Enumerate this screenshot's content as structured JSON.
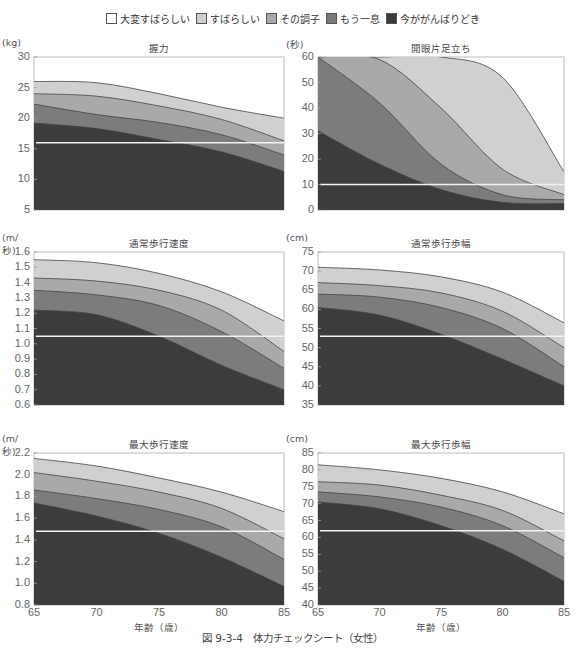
{
  "legend": [
    {
      "label": "大変すばらしい",
      "color": "#ffffff"
    },
    {
      "label": "すばらしい",
      "color": "#cfcfcf"
    },
    {
      "label": "その調子",
      "color": "#a8a8a8"
    },
    {
      "label": "もう一息",
      "color": "#7a7a7a"
    },
    {
      "label": "今ががんばりどき",
      "color": "#3a3a3a"
    }
  ],
  "caption": "図 9-3-4　体力チェックシート（女性）",
  "xlabel": "年齢（歳）",
  "chart_data": [
    {
      "type": "area",
      "title": "握力",
      "unit": "(kg)",
      "ylim": [
        5,
        30
      ],
      "yticks": [
        "30",
        "25",
        "20",
        "15",
        "10",
        "5"
      ],
      "x": [
        65,
        70,
        75,
        80,
        85
      ],
      "threshold": 16,
      "series": [
        {
          "name": "すばらしい",
          "values": [
            26,
            25.8,
            24,
            21.8,
            20
          ]
        },
        {
          "name": "その調子",
          "values": [
            24,
            23.6,
            22,
            19.8,
            16.3
          ]
        },
        {
          "name": "もう一息",
          "values": [
            22.3,
            20.6,
            19.3,
            17.3,
            14
          ]
        },
        {
          "name": "今ががんばりどき",
          "values": [
            19.2,
            18.3,
            16.5,
            14.5,
            11.3
          ]
        }
      ]
    },
    {
      "type": "area",
      "title": "開眼片足立ち",
      "unit": "(秒)",
      "ylim": [
        0,
        60
      ],
      "yticks": [
        "60",
        "50",
        "40",
        "30",
        "20",
        "10",
        "0"
      ],
      "x": [
        65,
        70,
        75,
        80,
        85
      ],
      "threshold": 10,
      "series": [
        {
          "name": "すばらしい",
          "values": [
            60,
            60,
            60,
            52,
            15
          ]
        },
        {
          "name": "その調子",
          "values": [
            60,
            59,
            40,
            16,
            6
          ]
        },
        {
          "name": "もう一息",
          "values": [
            60,
            42,
            18,
            6,
            4
          ]
        },
        {
          "name": "今ががんばりどき",
          "values": [
            31,
            18,
            8,
            3,
            2.5
          ]
        }
      ]
    },
    {
      "type": "area",
      "title": "通常歩行速度",
      "unit": "(m/ 秒)",
      "ylim": [
        0.6,
        1.6
      ],
      "yticks": [
        "1.6",
        "1.5",
        "1.4",
        "1.3",
        "1.2",
        "1.1",
        "1.0",
        "0.9",
        "0.8",
        "0.7",
        "0.6"
      ],
      "x": [
        65,
        70,
        75,
        80,
        85
      ],
      "threshold": 1.05,
      "series": [
        {
          "name": "すばらしい",
          "values": [
            1.55,
            1.53,
            1.46,
            1.34,
            1.15
          ]
        },
        {
          "name": "その調子",
          "values": [
            1.43,
            1.41,
            1.35,
            1.22,
            0.95
          ]
        },
        {
          "name": "もう一息",
          "values": [
            1.35,
            1.32,
            1.25,
            1.08,
            0.84
          ]
        },
        {
          "name": "今ががんばりどき",
          "values": [
            1.22,
            1.19,
            1.05,
            0.86,
            0.7
          ]
        }
      ]
    },
    {
      "type": "area",
      "title": "通常歩行歩幅",
      "unit": "(cm)",
      "ylim": [
        35,
        75
      ],
      "yticks": [
        "75",
        "70",
        "65",
        "60",
        "55",
        "50",
        "45",
        "40",
        "35"
      ],
      "x": [
        65,
        70,
        75,
        80,
        85
      ],
      "threshold": 53,
      "series": [
        {
          "name": "すばらしい",
          "values": [
            71,
            70.3,
            68.5,
            64.5,
            56.5
          ]
        },
        {
          "name": "その調子",
          "values": [
            67,
            66.2,
            64.3,
            59.5,
            50
          ]
        },
        {
          "name": "もう一息",
          "values": [
            64,
            63.2,
            60.5,
            55,
            45
          ]
        },
        {
          "name": "今ががんばりどき",
          "values": [
            60.5,
            58.5,
            53.5,
            47,
            40
          ]
        }
      ]
    },
    {
      "type": "area",
      "title": "最大歩行速度",
      "unit": "(m/ 秒)",
      "ylim": [
        0.8,
        2.2
      ],
      "yticks": [
        "2.2",
        "2.0",
        "1.8",
        "1.6",
        "1.4",
        "1.2",
        "1.0",
        "0.8"
      ],
      "x": [
        65,
        70,
        75,
        80,
        85
      ],
      "threshold": 1.48,
      "xticks": [
        "65",
        "70",
        "75",
        "80",
        "85"
      ],
      "series": [
        {
          "name": "すばらしい",
          "values": [
            2.15,
            2.08,
            1.97,
            1.84,
            1.66
          ]
        },
        {
          "name": "その調子",
          "values": [
            2.02,
            1.94,
            1.84,
            1.69,
            1.41
          ]
        },
        {
          "name": "もう一息",
          "values": [
            1.86,
            1.78,
            1.68,
            1.52,
            1.22
          ]
        },
        {
          "name": "今ががんばりどき",
          "values": [
            1.74,
            1.62,
            1.46,
            1.24,
            0.97
          ]
        }
      ]
    },
    {
      "type": "area",
      "title": "最大歩行歩幅",
      "unit": "(cm)",
      "ylim": [
        40,
        85
      ],
      "yticks": [
        "85",
        "80",
        "75",
        "70",
        "65",
        "60",
        "55",
        "50",
        "45",
        "40"
      ],
      "x": [
        65,
        70,
        75,
        80,
        85
      ],
      "threshold": 62,
      "xticks": [
        "65",
        "70",
        "75",
        "80",
        "85"
      ],
      "series": [
        {
          "name": "すばらしい",
          "values": [
            81.5,
            80,
            77.5,
            73.5,
            67
          ]
        },
        {
          "name": "その調子",
          "values": [
            76.5,
            75.5,
            72.5,
            68,
            59
          ]
        },
        {
          "name": "もう一息",
          "values": [
            73.5,
            72,
            69,
            63.5,
            54
          ]
        },
        {
          "name": "今ががんばりどき",
          "values": [
            70.5,
            68.5,
            63.5,
            56.5,
            47
          ]
        }
      ]
    }
  ]
}
